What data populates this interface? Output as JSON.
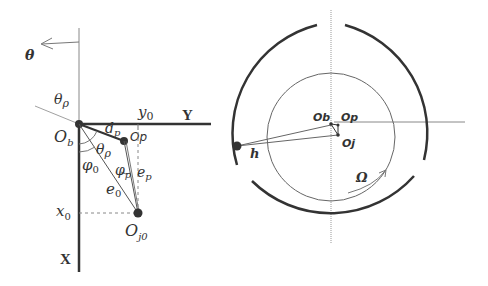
{
  "left_panel": {
    "labels": {
      "theta": "θ",
      "theta_p": "θρ",
      "y0": "y",
      "y0_sub": "0",
      "Y_axis": "Y",
      "Ob": "O",
      "Ob_sub": "b",
      "dp": "d",
      "dp_sub": "p",
      "Op": "Op",
      "theta_p_inner": "θρ",
      "phi0": "φ",
      "phi0_sub": "0",
      "phi_p": "φ",
      "phi_p_sub": "p",
      "ep": "e",
      "ep_sub": "p",
      "e0": "e",
      "e0_sub": "0",
      "x0": "x",
      "x0_sub": "0",
      "Oj0": "O",
      "Oj0_sub": "j0",
      "X_axis": "X"
    }
  },
  "right_panel": {
    "labels": {
      "Ob": "Ob",
      "Op": "Op",
      "Oj": "Oj",
      "h": "h",
      "Omega": "Ω"
    }
  },
  "colors": {
    "line": "#333333",
    "thin_line": "#777777",
    "background": "#ffffff"
  }
}
